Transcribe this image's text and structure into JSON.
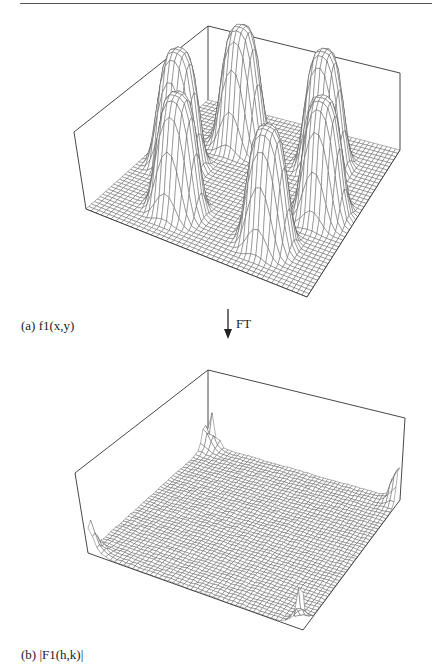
{
  "page": {
    "top_rule": true
  },
  "figure_a": {
    "caption": "(a)  f1(x,y)",
    "description": "3D wireframe surface with six smooth bumps on a flat grid plane",
    "box": {
      "apex": [
        208,
        26
      ],
      "left_top": [
        74,
        132
      ],
      "left_bottom": [
        86,
        209
      ],
      "right_top": [
        400,
        73
      ],
      "right_bottom": [
        400,
        150
      ],
      "front_bottom": [
        307,
        297
      ],
      "back_bottom": [
        208,
        100
      ]
    },
    "bumps": [
      {
        "u": 0.22,
        "v": 0.3,
        "h": 115
      },
      {
        "u": 0.22,
        "v": 0.72,
        "h": 115
      },
      {
        "u": 0.5,
        "v": 0.15,
        "h": 115
      },
      {
        "u": 0.5,
        "v": 0.85,
        "h": 115
      },
      {
        "u": 0.78,
        "v": 0.3,
        "h": 115
      },
      {
        "u": 0.78,
        "v": 0.72,
        "h": 115
      }
    ]
  },
  "arrow": {
    "label": "FT",
    "direction": "down"
  },
  "figure_b": {
    "caption": "(b)  |F1(h,k)|",
    "description": "3D wireframe surface of Fourier transform magnitude, mostly flat with noisy spikes at the corners",
    "box": {
      "apex": [
        208,
        25
      ],
      "left_top": [
        75,
        128
      ],
      "left_bottom": [
        88,
        208
      ],
      "right_top": [
        405,
        73
      ],
      "right_bottom": [
        400,
        155
      ],
      "front_bottom": [
        303,
        285
      ],
      "back_bottom": [
        208,
        100
      ]
    },
    "corner_spikes": [
      {
        "corner": "back",
        "h": 45
      },
      {
        "corner": "left",
        "h": 42
      },
      {
        "corner": "right",
        "h": 40
      },
      {
        "corner": "front",
        "h": 50
      }
    ]
  },
  "colors": {
    "line": "#333333",
    "grid": "#555555",
    "background": "#ffffff"
  }
}
